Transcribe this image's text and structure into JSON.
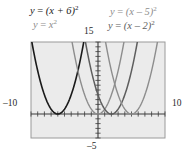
{
  "figure": {
    "kind": "graphing-calculator-plot",
    "background_color": "#ffffff",
    "plot_fill": "#ebebeb",
    "plot_border_color": "#9a9a9a"
  },
  "axis_labels": {
    "left": "–10",
    "right": "10",
    "top": "15",
    "bottom": "–5"
  },
  "curve_labels": {
    "plus6": {
      "lhs": "y",
      "eq": "=",
      "body": "(x + 6)",
      "exp": "2",
      "color": "#1a1a1a"
    },
    "xsq": {
      "lhs": "y",
      "eq": "=",
      "body": "x",
      "exp": "2",
      "color": "#8d8d8d"
    },
    "minus5": {
      "lhs": "y",
      "eq": "=",
      "body": "(x – 5)",
      "exp": "2",
      "color": "#8d8d8d"
    },
    "minus2": {
      "lhs": "y",
      "eq": "=",
      "body": "(x – 2)",
      "exp": "2",
      "color": "#5e5e5e"
    }
  },
  "chart_data": {
    "type": "line",
    "title": "",
    "xlabel": "",
    "ylabel": "",
    "xlim": [
      -10,
      10
    ],
    "ylim": [
      -5,
      15
    ],
    "grid": false,
    "legend_position": "above-plot",
    "tick_spacing": {
      "x": 1,
      "y": 1
    },
    "series": [
      {
        "name": "y = (x + 6)^2",
        "vertex": [
          -6,
          0
        ],
        "color": "#1a1a1a",
        "width": 1.6,
        "x": [
          -10,
          -9.5,
          -9,
          -8.5,
          -8,
          -7.5,
          -7,
          -6.5,
          -6,
          -5.5,
          -5,
          -4.5,
          -4,
          -3.5,
          -3,
          -2.5,
          -2.13
        ],
        "y": [
          16,
          12.25,
          9,
          6.25,
          4,
          2.25,
          1,
          0.25,
          0,
          0.25,
          1,
          2.25,
          4,
          6.25,
          9,
          12.25,
          15
        ]
      },
      {
        "name": "y = x^2",
        "vertex": [
          0,
          0
        ],
        "color": "#8d8d8d",
        "width": 1.4,
        "x": [
          -3.87,
          -3.5,
          -3,
          -2.5,
          -2,
          -1.5,
          -1,
          -0.5,
          0,
          0.5,
          1,
          1.5,
          2,
          2.5,
          3,
          3.5,
          3.87
        ],
        "y": [
          15,
          12.25,
          9,
          6.25,
          4,
          2.25,
          1,
          0.25,
          0,
          0.25,
          1,
          2.25,
          4,
          6.25,
          9,
          12.25,
          15
        ]
      },
      {
        "name": "y = (x - 2)^2",
        "vertex": [
          2,
          0
        ],
        "color": "#5e5e5e",
        "width": 1.5,
        "x": [
          -1.87,
          -1.5,
          -1,
          -0.5,
          0,
          0.5,
          1,
          1.5,
          2,
          2.5,
          3,
          3.5,
          4,
          4.5,
          5,
          5.5,
          5.87
        ],
        "y": [
          15,
          12.25,
          9,
          6.25,
          4,
          2.25,
          1,
          0.25,
          0,
          0.25,
          1,
          2.25,
          4,
          6.25,
          9,
          12.25,
          15
        ]
      },
      {
        "name": "y = (x - 5)^2",
        "vertex": [
          5,
          0
        ],
        "color": "#8d8d8d",
        "width": 1.4,
        "x": [
          1.13,
          1.5,
          2,
          2.5,
          3,
          3.5,
          4,
          4.5,
          5,
          5.5,
          6,
          6.5,
          7,
          7.5,
          8,
          8.5,
          8.87
        ],
        "y": [
          15,
          12.25,
          9,
          6.25,
          4,
          2.25,
          1,
          0.25,
          0,
          0.25,
          1,
          2.25,
          4,
          6.25,
          9,
          12.25,
          15
        ]
      }
    ]
  }
}
